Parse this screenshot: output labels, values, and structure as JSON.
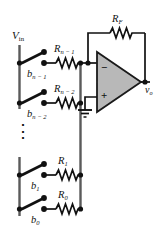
{
  "figure": {
    "name": "binary-weighted-resistor-dac",
    "colors": {
      "wire": "#1a1a1a",
      "rail": "#555555",
      "opamp_fill": "#b3b3b3",
      "opamp_stroke": "#1a1a1a",
      "background": "#ffffff"
    }
  },
  "labels": {
    "input_rail": {
      "base": "V",
      "sub": "in",
      "text": "Vin"
    },
    "output": {
      "base": "v",
      "sub": "o",
      "text": "vo"
    },
    "feedback_resistor": {
      "base": "R",
      "sub": "F",
      "text": "RF"
    },
    "opamp_minus": "−",
    "opamp_plus": "+",
    "ellipsis": "⋮"
  },
  "rows": [
    {
      "id": "msb",
      "switch": {
        "base": "b",
        "sub": "n − 1",
        "text": "bn-1"
      },
      "resistor": {
        "base": "R",
        "sub": "n − 1",
        "text": "Rn-1"
      },
      "y": 63
    },
    {
      "id": "msb-1",
      "switch": {
        "base": "b",
        "sub": "n − 2",
        "text": "bn-2"
      },
      "resistor": {
        "base": "R",
        "sub": "n − 2",
        "text": "Rn-2"
      },
      "y": 103
    },
    {
      "id": "bit1",
      "switch": {
        "base": "b",
        "sub": "1",
        "text": "b1"
      },
      "resistor": {
        "base": "R",
        "sub": "1",
        "text": "R1"
      },
      "y": 175
    },
    {
      "id": "lsb",
      "switch": {
        "base": "b",
        "sub": "0",
        "text": "b0"
      },
      "resistor": {
        "base": "R",
        "sub": "0",
        "text": "R0"
      },
      "y": 209
    }
  ],
  "nodes": {
    "ground": "ground-symbol",
    "summing_node": "inverting-input-node",
    "output_node": "output-node"
  }
}
